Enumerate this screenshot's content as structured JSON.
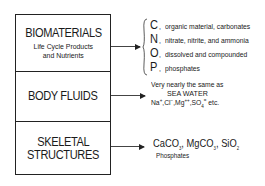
{
  "diagram": {
    "boxes": [
      {
        "title": "BIOMATERIALS",
        "subtitle_line1": "Life Cycle Products",
        "subtitle_line2": "and Nutrients"
      },
      {
        "title": "BODY FLUIDS"
      },
      {
        "title_line1": "SKELETAL",
        "title_line2": "STRUCTURES"
      }
    ],
    "biomaterials_elements": [
      {
        "symbol": "C",
        "sep": ",",
        "description": "organic material, carbonates"
      },
      {
        "symbol": "N",
        "sep": ",",
        "description": "nitrate, nitrite, and ammonia"
      },
      {
        "symbol": "O",
        "sep": ",",
        "description": "dissolved and compounded"
      },
      {
        "symbol": "P",
        "sep": ",",
        "description": "phosphates"
      }
    ],
    "body_fluids": {
      "line1": "Very nearly the same as",
      "line2": "SEA WATER",
      "ions": {
        "na": "Na",
        "na_charge": "+",
        "cl": "Cl",
        "cl_charge": "−",
        "mg": "Mg",
        "mg_charge": "++",
        "so": "SO",
        "so_sub": "4",
        "so_charge": "=",
        "etc": "etc."
      }
    },
    "skeletal": {
      "caco": "CaCO",
      "caco_sub": "3",
      "mgco": "MgCO",
      "mgco_sub": "3",
      "sio": "SiO",
      "sio_sub": "2",
      "line2": "Phosphates"
    },
    "colors": {
      "line": "#222222",
      "text": "#1a1a1a",
      "background": "#ffffff"
    }
  }
}
